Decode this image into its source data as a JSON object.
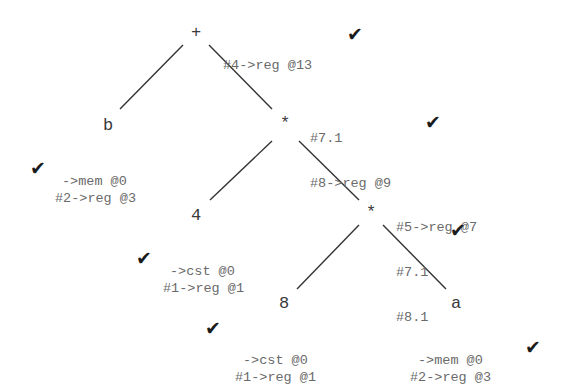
{
  "diagram": {
    "type": "expression-tree",
    "check_glyph": "✔",
    "nodes": {
      "plus": {
        "label": "+",
        "annotations": [
          "#4->reg @13"
        ],
        "checked": true
      },
      "mul1": {
        "label": "*",
        "annotations": [
          "#7.1",
          "#8->reg @9"
        ],
        "checked": true
      },
      "b": {
        "label": "b",
        "annotations": [
          "->mem @0",
          "#2->reg @3"
        ],
        "checked": true
      },
      "four": {
        "label": "4",
        "annotations": [
          "->cst @0",
          "#1->reg @1"
        ],
        "checked": true
      },
      "mul2": {
        "label": "*",
        "annotations": [
          "#5->reg @7",
          "#7.1",
          "#8.1"
        ],
        "checked": true
      },
      "eight": {
        "label": "8",
        "annotations": [
          "->cst @0",
          "#1->reg @1"
        ],
        "checked": true
      },
      "a": {
        "label": "a",
        "annotations": [
          "->mem @0",
          "#2->reg @3"
        ],
        "checked": true
      }
    },
    "edges": [
      {
        "from": "plus",
        "to": "b"
      },
      {
        "from": "plus",
        "to": "mul1"
      },
      {
        "from": "mul1",
        "to": "four"
      },
      {
        "from": "mul1",
        "to": "mul2"
      },
      {
        "from": "mul2",
        "to": "eight"
      },
      {
        "from": "mul2",
        "to": "a"
      }
    ]
  }
}
